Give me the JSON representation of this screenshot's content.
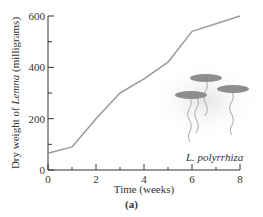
{
  "chart_data": {
    "type": "line",
    "title": "",
    "xlabel": "Time (weeks)",
    "ylabel_prefix": "Dry weight of ",
    "ylabel_italic": "Lemna",
    "ylabel_suffix": " (milligrams)",
    "x": [
      0,
      1,
      2,
      3,
      4,
      5,
      6,
      7,
      8
    ],
    "series": [
      {
        "name": "L. polyrrhiza",
        "values": [
          65,
          90,
          200,
          300,
          355,
          420,
          540,
          570,
          600
        ]
      }
    ],
    "xlim": [
      0,
      8
    ],
    "ylim": [
      0,
      600
    ],
    "xticks_major": [
      0,
      2,
      4,
      6,
      8
    ],
    "xticks_minor": [
      1,
      3,
      5,
      7
    ],
    "yticks_major": [
      0,
      200,
      400,
      600
    ],
    "yticks_minor": [
      100,
      300,
      500
    ],
    "grid": false,
    "line_color": "#9a9a9a",
    "annotation": "L. polyrrhiza",
    "caption": "(a)"
  },
  "labels": {
    "species": "L. polyrrhiza",
    "caption": "(a)",
    "xlabel": "Time (weeks)"
  }
}
